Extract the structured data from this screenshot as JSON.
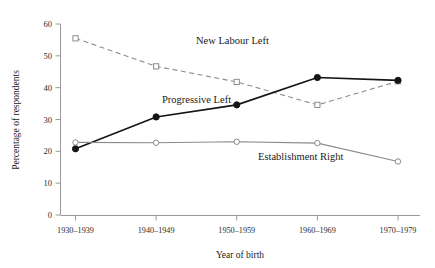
{
  "chart_data": {
    "type": "line",
    "title": "",
    "xlabel": "Year of birth",
    "ylabel": "Percentage of respondents",
    "categories": [
      "1930–1939",
      "1940–1949",
      "1950–1959",
      "1960–1969",
      "1970–1979"
    ],
    "yticks": [
      0,
      10,
      20,
      30,
      40,
      50,
      60
    ],
    "ylim": [
      0,
      60
    ],
    "grid": false,
    "legend_position": "inline-annotations",
    "series": [
      {
        "name": "New Labour Left",
        "values": [
          55.5,
          46.7,
          41.8,
          34.6,
          42.0
        ],
        "style": "dashed",
        "color": "#8c8c8c",
        "marker": "open-square",
        "label_x": 196,
        "label_y": 44
      },
      {
        "name": "Progressive Left",
        "values": [
          20.8,
          30.8,
          34.6,
          43.2,
          42.3
        ],
        "style": "solid",
        "color": "#141414",
        "marker": "filled-circle",
        "label_x": 162,
        "label_y": 103
      },
      {
        "name": "Establishment Right",
        "values": [
          22.8,
          22.7,
          23.0,
          22.6,
          16.8
        ],
        "style": "solid",
        "color": "#8a8a8a",
        "marker": "open-circle",
        "label_x": 258,
        "label_y": 160
      }
    ]
  },
  "axes": {
    "y_axis_title": "Percentage of respondents",
    "x_axis_title": "Year of birth",
    "y_tick_labels": [
      "60",
      "50",
      "40",
      "30",
      "20",
      "10",
      "0"
    ],
    "x_tick_labels": [
      "1930–1939",
      "1940–1949",
      "1950–1959",
      "1960–1969",
      "1970–1979"
    ]
  },
  "annotations": {
    "new_labour_left": "New Labour Left",
    "progressive_left": "Progressive Left",
    "establishment_right": "Establishment Right"
  },
  "colors": {
    "new_labour_left": "#8c8c8c",
    "progressive_left": "#141414",
    "establishment_right": "#8a8a8a",
    "axis": "#9a9a9a",
    "text": "#1a1a1a",
    "background": "#ffffff"
  }
}
